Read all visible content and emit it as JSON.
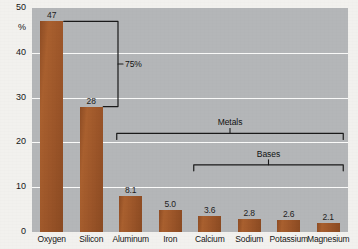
{
  "chart_data": {
    "type": "bar",
    "title": "",
    "xlabel": "",
    "ylabel": "%",
    "ylim": [
      0,
      50
    ],
    "yticks": [
      0,
      10,
      20,
      30,
      40,
      50
    ],
    "ytick_labels": [
      "0",
      "10",
      "20",
      "30",
      "40",
      "50"
    ],
    "grid": true,
    "grid_color": "#fbfbfa",
    "legend": "none",
    "bar_color": "#a25a2c",
    "plot_background": "#b4b6b8",
    "categories": [
      "Oxygen",
      "Silicon",
      "Aluminum",
      "Iron",
      "Calcium",
      "Sodium",
      "Potassium",
      "Magnesium"
    ],
    "values": [
      47,
      28,
      8.1,
      5.0,
      3.6,
      2.8,
      2.6,
      2.1
    ],
    "value_labels": [
      "47",
      "28",
      "8.1",
      "5.0",
      "3.6",
      "2.8",
      "2.6",
      "2.1"
    ],
    "annotations": [
      {
        "name": "seventy-five-percent-bracket",
        "label": "75%",
        "spans_from_value": 47,
        "spans_to_value": 28,
        "orientation": "vertical"
      },
      {
        "name": "metals-bracket",
        "label": "Metals",
        "spans_from_category": "Aluminum",
        "spans_to_category": "Magnesium",
        "at_value": 22,
        "orientation": "horizontal"
      },
      {
        "name": "bases-bracket",
        "label": "Bases",
        "spans_from_category": "Calcium",
        "spans_to_category": "Magnesium",
        "at_value": 15,
        "orientation": "horizontal"
      }
    ]
  },
  "axis": {
    "y_unit_symbol": "%"
  }
}
